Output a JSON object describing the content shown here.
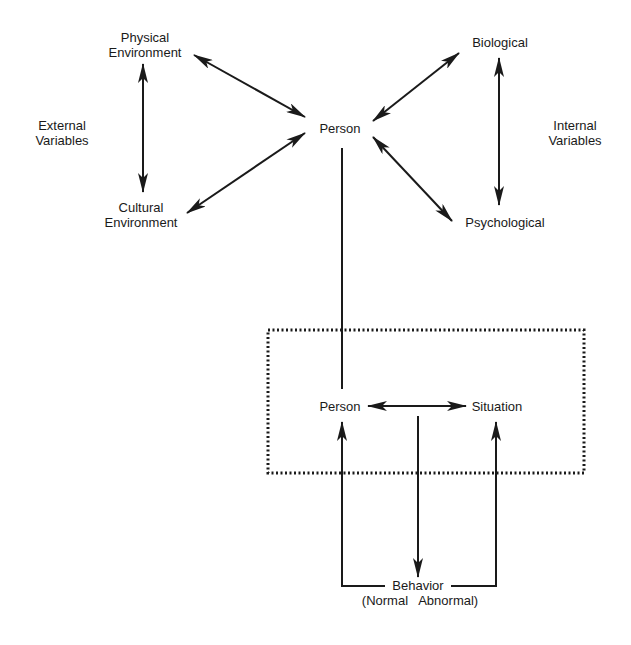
{
  "nodes": {
    "physical_environment": "Physical\nEnvironment",
    "physical_line1": "Physical",
    "physical_line2": "Environment",
    "cultural_line1": "Cultural",
    "cultural_line2": "Environment",
    "external_line1": "External",
    "external_line2": "Variables",
    "person_top": "Person",
    "biological": "Biological",
    "psychological": "Psychological",
    "internal_line1": "Internal",
    "internal_line2": "Variables",
    "person_box": "Person",
    "situation": "Situation",
    "behavior": "Behavior",
    "behavior_sub": "(Normal   Abnormal)"
  },
  "colors": {
    "ink": "#1a1a1a",
    "background": "#ffffff"
  }
}
